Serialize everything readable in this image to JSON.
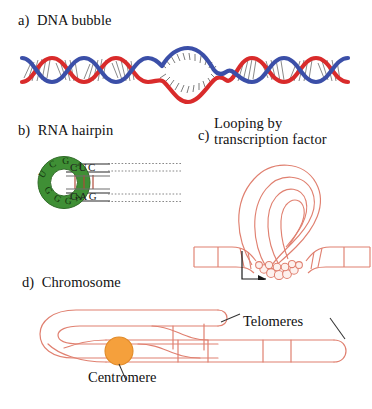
{
  "figure": {
    "background_color": "#ffffff"
  },
  "colors": {
    "dna_strand_blue": "#3b4fa8",
    "dna_strand_red": "#d92b2b",
    "base_pair_gray": "#7a7a7a",
    "rna_loop_green": "#3f8f35",
    "rna_loop_green_dark": "#2f6b27",
    "loop_letter": "#1d4a17",
    "salmon_outline": "#e08070",
    "centromere_orange": "#f5a03c",
    "centromere_orange_stroke": "#e08a28",
    "text_black": "#111111",
    "leader_line": "#333333"
  },
  "panels": [
    {
      "id": "a",
      "index_label": "a)",
      "title": "DNA bubble",
      "full_label": "a)  DNA bubble",
      "description": "Double helix with a denatured bubble in the center",
      "strands": [
        "blue",
        "red"
      ],
      "helix_turns": 10,
      "bubble_present": true
    },
    {
      "id": "b",
      "index_label": "b)",
      "title": "RNA hairpin",
      "full_label": "b)  RNA hairpin",
      "description": "Green circular loop with stem duplex",
      "loop_bases": [
        "U",
        "C",
        "G",
        "A",
        "A",
        "G",
        "G",
        "G"
      ],
      "stem_top_bases": "CUC",
      "stem_bottom_bases": "GAG",
      "stem_bond_count": 3
    },
    {
      "id": "c",
      "index_label": "c)",
      "title_line1": "Looping by",
      "title_line2": "transcription factor",
      "full_label": "c)  Looping by transcription factor",
      "description": "DNA loop held closed by a protein complex at the crossing point",
      "has_arrow_annotation": true,
      "arrow_points_to": "transcription factor protein complex"
    },
    {
      "id": "d",
      "index_label": "d)",
      "title": "Chromosome",
      "full_label": "d)  Chromosome",
      "description": "Folded chromosome with centromere and telomeres",
      "annotations": [
        {
          "name": "telomeres",
          "label": "Telomeres",
          "leader_lines": 2
        },
        {
          "name": "centromere",
          "label": "Centromere",
          "leader_lines": 1
        }
      ]
    }
  ],
  "labels": {
    "panel_a": "a)  DNA bubble",
    "panel_b": "b)  RNA hairpin",
    "panel_c_index": "c)",
    "panel_c_line1": "Looping by",
    "panel_c_line2": "transcription factor",
    "panel_d": "d)  Chromosome",
    "telomeres": "Telomeres",
    "centromere": "Centromere",
    "rna_loop": [
      "U",
      "C",
      "G",
      "A",
      "A",
      "G",
      "G",
      "G"
    ],
    "rna_stem_top": "CUC",
    "rna_stem_bottom": "GAG"
  }
}
